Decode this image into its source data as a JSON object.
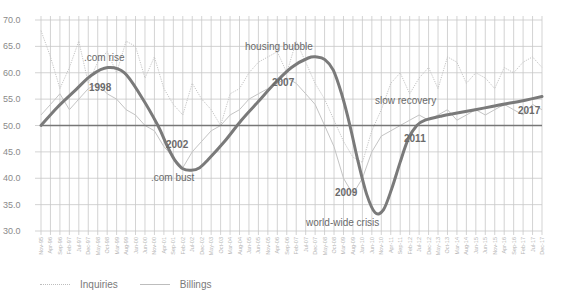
{
  "chart_data": {
    "type": "line",
    "title": "",
    "xlabel": "",
    "ylabel": "",
    "ylim": [
      30.0,
      70.0
    ],
    "yticks": [
      "70.0",
      "65.0",
      "60.0",
      "55.0",
      "50.0",
      "45.0",
      "40.0",
      "35.0",
      "30.0"
    ],
    "grid": true,
    "legend_position": "bottom-left",
    "x_tick_labels": [
      "Nov-95",
      "Apr-96",
      "Sep-96",
      "Feb-97",
      "Jul-97",
      "Dec-97",
      "May-98",
      "Oct-98",
      "Mar-99",
      "Aug-99",
      "Jan-00",
      "Jun-00",
      "Nov-00",
      "Apr-01",
      "Sep-01",
      "Feb-02",
      "Jul-02",
      "Dec-02",
      "May-03",
      "Oct-03",
      "Mar-04",
      "Aug-04",
      "Jan-05",
      "Jun-05",
      "Nov-05",
      "Apr-06",
      "Sep-06",
      "Feb-07",
      "Jul-07",
      "Dec-07",
      "May-08",
      "Oct-08",
      "Mar-09",
      "Aug-09",
      "Jan-10",
      "Jun-10",
      "Nov-10",
      "Apr-11",
      "Sep-11",
      "Feb-12",
      "Jul-12",
      "Dec-12",
      "May-13",
      "Oct-13",
      "Mar-14",
      "Aug-14",
      "Jan-15",
      "Jun-15",
      "Nov-15",
      "Apr-16",
      "Sep-16",
      "Feb-17",
      "Jul-17",
      "Dec-17"
    ],
    "reference_line": {
      "value": 50.0
    },
    "series": [
      {
        "name": "Inquiries",
        "style": "dotted",
        "color": "#c4c4c4",
        "values": [
          68,
          63,
          57,
          61,
          66,
          58,
          62,
          64,
          60,
          66,
          65,
          59,
          63,
          57,
          54,
          52,
          58,
          55,
          53,
          50,
          56,
          57,
          60,
          62,
          63,
          64,
          60,
          66,
          62,
          58,
          55,
          51,
          47,
          44,
          43,
          49,
          53,
          58,
          60,
          56,
          59,
          61,
          57,
          63,
          62,
          58,
          60,
          59,
          57,
          61,
          60,
          62,
          63,
          61
        ]
      },
      {
        "name": "Billings",
        "style": "solid",
        "color": "#c4c4c4",
        "values": [
          52,
          54,
          56,
          53,
          55,
          57,
          58,
          56,
          55,
          53,
          52,
          50,
          49,
          46,
          44,
          42,
          45,
          47,
          49,
          50,
          52,
          53,
          55,
          56,
          57,
          58,
          59,
          58,
          56,
          54,
          50,
          46,
          40,
          37,
          40,
          45,
          48,
          49,
          50,
          51,
          52,
          51,
          52,
          53,
          51,
          52,
          53,
          52,
          53,
          54,
          53,
          52,
          54,
          53
        ]
      },
      {
        "name": "Trend",
        "style": "thick",
        "color": "#7a7a7a",
        "points": [
          [
            0,
            50
          ],
          [
            2,
            53.5
          ],
          [
            4,
            56.5
          ],
          [
            6,
            59.5
          ],
          [
            8,
            61
          ],
          [
            10,
            60
          ],
          [
            12,
            55.5
          ],
          [
            14,
            50
          ],
          [
            15,
            46.5
          ],
          [
            16,
            43.5
          ],
          [
            17,
            41.8
          ],
          [
            18,
            41.5
          ],
          [
            19,
            42
          ],
          [
            20,
            43.5
          ],
          [
            22,
            47
          ],
          [
            24,
            51
          ],
          [
            26,
            54.5
          ],
          [
            28,
            58
          ],
          [
            30,
            61
          ],
          [
            32,
            62.8
          ],
          [
            33,
            63
          ],
          [
            34,
            62.5
          ],
          [
            35,
            60.5
          ],
          [
            36,
            56
          ],
          [
            37,
            50
          ],
          [
            38,
            43
          ],
          [
            39,
            37
          ],
          [
            40,
            33.5
          ],
          [
            41,
            34
          ],
          [
            42,
            38
          ],
          [
            43,
            43
          ],
          [
            44,
            47.5
          ],
          [
            45,
            50
          ],
          [
            46,
            51
          ],
          [
            48,
            51.8
          ],
          [
            50,
            52.4
          ],
          [
            52,
            53
          ],
          [
            54,
            53.6
          ],
          [
            56,
            54.2
          ],
          [
            58,
            54.8
          ],
          [
            60,
            55.5
          ]
        ],
        "x_scale": "0..60 mapped to Nov-95..Dec-17"
      }
    ],
    "annotations": [
      {
        "text": ".com rise",
        "type": "label"
      },
      {
        "text": "1998",
        "type": "year"
      },
      {
        "text": "2002",
        "type": "year"
      },
      {
        "text": ".com bust",
        "type": "label"
      },
      {
        "text": "housing bubble",
        "type": "label"
      },
      {
        "text": "2007",
        "type": "year"
      },
      {
        "text": "2009",
        "type": "year"
      },
      {
        "text": "world-wide crisis",
        "type": "label"
      },
      {
        "text": "slow recovery",
        "type": "label"
      },
      {
        "text": "2011",
        "type": "year"
      },
      {
        "text": "2017",
        "type": "year"
      }
    ]
  },
  "legend": {
    "inquiries": "Inquiries",
    "billings": "Billings"
  }
}
